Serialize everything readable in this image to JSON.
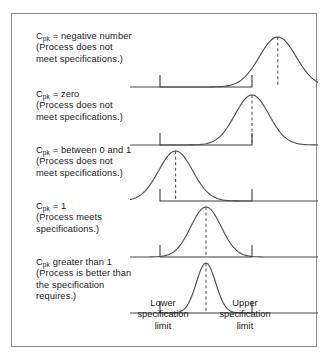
{
  "figure": {
    "title_present": false,
    "border_color": "#8d8d8d",
    "curve_color": "#4a4a4a",
    "axis_color": "#3a3a3a",
    "text_color": "#1a1a1a",
    "background": "#ffffff"
  },
  "rows": [
    {
      "id": "cpk-negative",
      "lines": [
        "C_pk = negative number",
        "(Process does not",
        "meet specifications.)"
      ],
      "cpk_prefix": "C",
      "cpk_sub": "pk",
      "cpk_rest": " = negative number",
      "line2": "(Process does not",
      "line3": "meet specifications.)",
      "line4": "",
      "peak_offset": 0.78,
      "sigma": 0.2,
      "description": "Distribution centered well above the upper specification limit"
    },
    {
      "id": "cpk-zero",
      "cpk_prefix": "C",
      "cpk_sub": "pk",
      "cpk_rest": " = zero",
      "line2": "(Process does not",
      "line3": "meet specifications.)",
      "line4": "",
      "peak_offset": 0.5,
      "sigma": 0.185,
      "description": "Distribution peak exactly at the upper specification limit"
    },
    {
      "id": "cpk-between-0-and-1",
      "cpk_prefix": "C",
      "cpk_sub": "pk",
      "cpk_rest": " = between 0 and 1",
      "line2": "(Process does not",
      "line3": "meet specifications.)",
      "line4": "",
      "peak_offset": -0.33,
      "sigma": 0.185,
      "description": "Distribution shifted left, tail crosses the lower specification limit"
    },
    {
      "id": "cpk-equals-1",
      "cpk_prefix": "C",
      "cpk_sub": "pk",
      "cpk_rest": " = 1",
      "line2": "(Process meets",
      "line3": "specifications.)",
      "line4": "",
      "peak_offset": 0.0,
      "sigma": 0.165,
      "description": "Distribution centered, tails just reach both specification limits"
    },
    {
      "id": "cpk-greater-than-1",
      "cpk_prefix": "C",
      "cpk_sub": "pk",
      "cpk_rest": " greater than 1",
      "line2": "(Process is better than",
      "line3": "the specification",
      "line4": "requires.)",
      "peak_offset": 0.0,
      "sigma": 0.105,
      "description": "Narrow distribution well inside both specification limits"
    }
  ],
  "axis_labels": {
    "lower": [
      "Lower",
      "specification",
      "limit"
    ],
    "lower_l1": "Lower",
    "lower_l2": "specification",
    "lower_l3": "limit",
    "upper": [
      "Upper",
      "specification",
      "limit"
    ],
    "upper_l1": "Upper",
    "upper_l2": "specification",
    "upper_l3": "limit"
  },
  "chart_data": {
    "type": "line",
    "title": "",
    "xlabel": "",
    "ylabel": "",
    "grid": false,
    "legend": "none",
    "annotations": [
      "Lower specification limit",
      "Upper specification limit"
    ],
    "series": [
      {
        "name": "Cpk = negative number",
        "distribution": "normal",
        "mean_relative_to_limits": 0.78,
        "sigma_relative": 0.2
      },
      {
        "name": "Cpk = zero",
        "distribution": "normal",
        "mean_relative_to_limits": 0.5,
        "sigma_relative": 0.185
      },
      {
        "name": "Cpk = between 0 and 1",
        "distribution": "normal",
        "mean_relative_to_limits": -0.33,
        "sigma_relative": 0.185
      },
      {
        "name": "Cpk = 1",
        "distribution": "normal",
        "mean_relative_to_limits": 0.0,
        "sigma_relative": 0.165
      },
      {
        "name": "Cpk greater than 1",
        "distribution": "normal",
        "mean_relative_to_limits": 0.0,
        "sigma_relative": 0.105
      }
    ],
    "xlim": [
      -0.5,
      0.5
    ],
    "note": "mean_relative_to_limits is expressed in units of the spec-limit span where -0.5 is the lower limit and +0.5 is the upper limit"
  }
}
